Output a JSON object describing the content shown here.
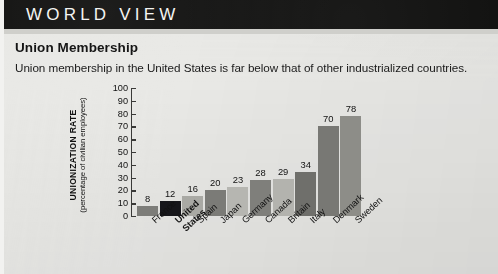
{
  "header": {
    "band_label": "WORLD VIEW"
  },
  "chart_title": "Union Membership",
  "chart_subtitle": "Union membership in the United States is far below that of other industrialized countries.",
  "axis_title_line1": "UNIONIZATION RATE",
  "axis_title_line2": "(percentage of civilian employees)",
  "colors": {
    "page_background": "#e9e9e6",
    "band_background": "#111110",
    "band_text": "#f4f4f2",
    "axis": "#3a3a38",
    "text": "#111111",
    "highlight_bar": "#16161a"
  },
  "chart_data": {
    "type": "bar",
    "title": "Union Membership",
    "subtitle": "Union membership in the United States is far below that of other industrialized countries.",
    "xlabel": "",
    "ylabel": "UNIONIZATION RATE (percentage of civilian employees)",
    "ylim": [
      0,
      100
    ],
    "yticks": [
      0,
      10,
      20,
      30,
      40,
      50,
      60,
      70,
      80,
      90,
      100
    ],
    "ytick_labels": [
      "0",
      "10",
      "20",
      "30",
      "40",
      "50",
      "60",
      "70",
      "80",
      "90",
      "100"
    ],
    "grid": false,
    "legend": "none",
    "categories": [
      "France",
      "United States",
      "Spain",
      "Japan",
      "Germany",
      "Canada",
      "Britain",
      "Italy",
      "Denmark",
      "Sweden"
    ],
    "values": [
      8,
      12,
      16,
      20,
      23,
      28,
      29,
      34,
      70,
      78
    ],
    "data_labels": [
      "8",
      "12",
      "16",
      "20",
      "23",
      "28",
      "29",
      "34",
      "70",
      "78"
    ],
    "bars": [
      {
        "label": "France",
        "label_line1": "France",
        "label_line2": "",
        "value": 8,
        "data_label": "8",
        "color": "#7d7d79",
        "bold": false
      },
      {
        "label": "United States",
        "label_line1": "United",
        "label_line2": "States",
        "value": 12,
        "data_label": "12",
        "color": "#16161a",
        "bold": true
      },
      {
        "label": "Spain",
        "label_line1": "Spain",
        "label_line2": "",
        "value": 16,
        "data_label": "16",
        "color": "#a9a9a4",
        "bold": false
      },
      {
        "label": "Japan",
        "label_line1": "Japan",
        "label_line2": "",
        "value": 20,
        "data_label": "20",
        "color": "#7b7b77",
        "bold": false
      },
      {
        "label": "Germany",
        "label_line1": "Germany",
        "label_line2": "",
        "value": 23,
        "data_label": "23",
        "color": "#b6b6b1",
        "bold": false
      },
      {
        "label": "Canada",
        "label_line1": "Canada",
        "label_line2": "",
        "value": 28,
        "data_label": "28",
        "color": "#7f7f7b",
        "bold": false
      },
      {
        "label": "Britain",
        "label_line1": "Britain",
        "label_line2": "",
        "value": 29,
        "data_label": "29",
        "color": "#b3b3ae",
        "bold": false
      },
      {
        "label": "Italy",
        "label_line1": "Italy",
        "label_line2": "",
        "value": 34,
        "data_label": "34",
        "color": "#6f6f6b",
        "bold": false
      },
      {
        "label": "Denmark",
        "label_line1": "Denmark",
        "label_line2": "",
        "value": 70,
        "data_label": "70",
        "color": "#787874",
        "bold": false
      },
      {
        "label": "Sweden",
        "label_line1": "Sweden",
        "label_line2": "",
        "value": 78,
        "data_label": "78",
        "color": "#8d8d88",
        "bold": false
      }
    ]
  }
}
